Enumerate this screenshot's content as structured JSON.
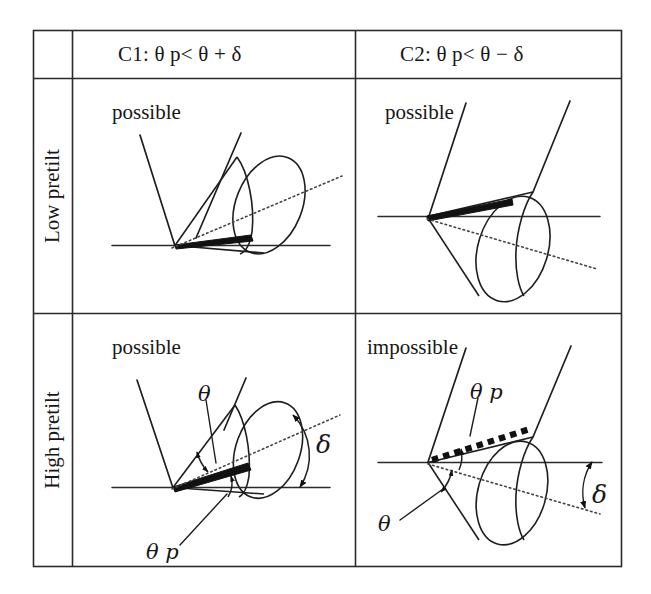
{
  "figure": {
    "line_color": "#1a1a1a",
    "background": "#ffffff"
  },
  "table": {
    "corner_cell": "",
    "column_headers": [
      {
        "id": "c1",
        "label": "C1: θ p< θ + δ",
        "condition": "C1",
        "expression": "θp < θ + δ"
      },
      {
        "id": "c2",
        "label": "C2: θ p< θ − δ",
        "condition": "C2",
        "expression": "θp < θ − δ"
      }
    ],
    "row_headers": [
      {
        "id": "low",
        "label": "Low pretilt"
      },
      {
        "id": "high",
        "label": "High pretilt"
      }
    ]
  },
  "cells": {
    "low_c1": {
      "verdict": "possible",
      "annotations": []
    },
    "low_c2": {
      "verdict": "possible",
      "annotations": []
    },
    "high_c1": {
      "verdict": "possible",
      "annotations": [
        {
          "id": "theta",
          "label": "θ"
        },
        {
          "id": "theta-p",
          "label": "θ p"
        },
        {
          "id": "delta",
          "label": "δ"
        }
      ]
    },
    "high_c2": {
      "verdict": "impossible",
      "annotations": [
        {
          "id": "theta-p",
          "label": "θ p"
        },
        {
          "id": "theta",
          "label": "θ"
        },
        {
          "id": "delta",
          "label": "δ"
        }
      ]
    }
  },
  "symbols": {
    "theta": "θ",
    "delta": "δ",
    "p": "p",
    "less_than": "<",
    "plus": "+",
    "minus": "−"
  }
}
